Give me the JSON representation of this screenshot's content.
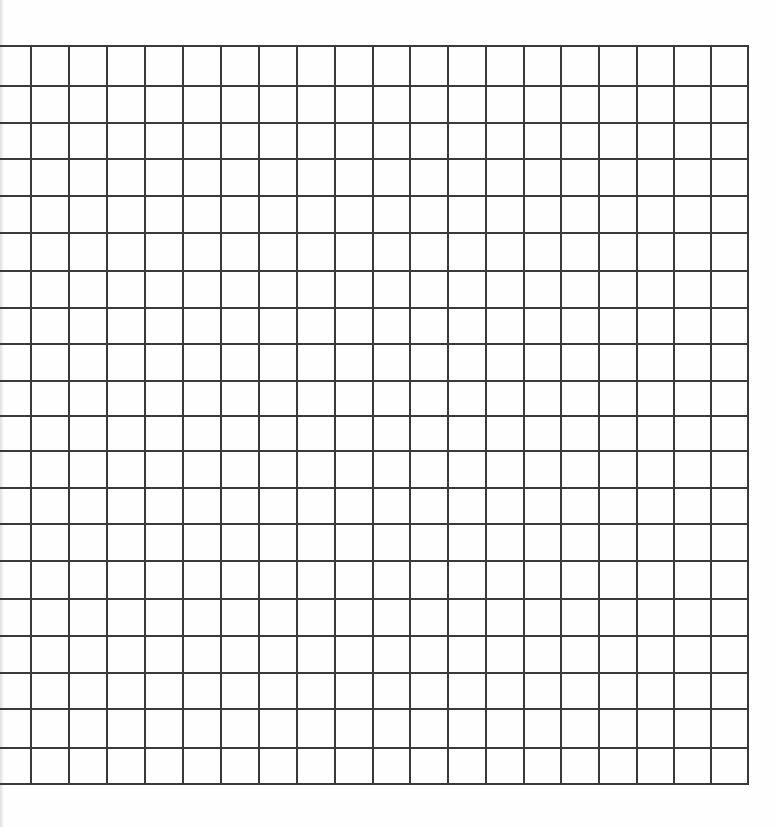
{
  "document": {
    "title": "Blank graph paper grid",
    "background_color": "#ffffff",
    "canvas": {
      "width": 777,
      "height": 827
    }
  },
  "grid": {
    "name": "square-grid",
    "line_color": "#3a3a3a",
    "line_width_px": 2,
    "cell_width_px": 38,
    "cell_height_px": 36.9,
    "origin_x_px": 30,
    "origin_y_px": 45,
    "right_edge_px": 747,
    "bottom_edge_px": 783,
    "columns": 19,
    "rows": 20,
    "vertical_line_count": 20,
    "horizontal_line_count": 21,
    "left_column_clipped": true,
    "vertical_lines_x": [
      30,
      68,
      106,
      144,
      182,
      220,
      258,
      296,
      334,
      372,
      409,
      447,
      485,
      523,
      560,
      598,
      636,
      673,
      710,
      747
    ],
    "horizontal_lines_y": [
      45,
      85,
      122,
      158,
      195,
      232,
      270,
      307,
      343,
      380,
      415,
      450,
      487,
      523,
      560,
      598,
      635,
      672,
      708,
      747,
      783
    ],
    "margins": {
      "top_px": 45,
      "left_px": 0,
      "right_px": 30,
      "bottom_px": 44
    }
  },
  "chart_data": {
    "type": "table",
    "title": "",
    "xlabel": "",
    "ylabel": "",
    "categories": [],
    "values": [],
    "grid": true,
    "legend": "none"
  }
}
